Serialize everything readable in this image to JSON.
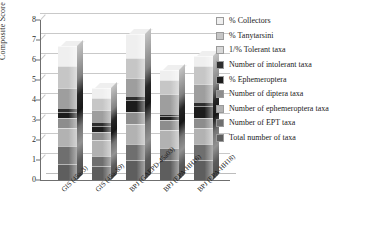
{
  "chart_data": {
    "type": "bar",
    "stacked": true,
    "title": "",
    "xlabel": "",
    "ylabel": "Composite Score",
    "ylim": [
      0,
      8
    ],
    "yticks": [
      0,
      1,
      2,
      3,
      4,
      5,
      6,
      7,
      8
    ],
    "grid": true,
    "legend_position": "right",
    "categories": [
      "GIS (45a-3)",
      "GIS (45a-89)",
      "BPJ (GAEPD-45a03)",
      "BPJ (EPA-HH16)",
      "BPJ (EPA-HH18)"
    ],
    "series": [
      {
        "name": "Total number of taxa",
        "color": "#5e5e5e",
        "values": [
          0.8,
          0.7,
          1.0,
          1.0,
          1.0
        ]
      },
      {
        "name": "Number of EPT taxa",
        "color": "#6f6f6f",
        "values": [
          0.9,
          0.5,
          0.8,
          0.6,
          0.8
        ]
      },
      {
        "name": "Number of ephemeroptera taxa",
        "color": "#b2b2b2",
        "values": [
          0.9,
          0.8,
          1.0,
          0.9,
          0.8
        ]
      },
      {
        "name": "Number of diptera taxa",
        "color": "#8d8d8d",
        "values": [
          0.5,
          0.4,
          0.6,
          0.5,
          0.5
        ]
      },
      {
        "name": "% Ephemeroptera",
        "color": "#1c1c1c",
        "values": [
          0.3,
          0.3,
          0.6,
          0.2,
          0.6
        ]
      },
      {
        "name": "Number of intolerant taxa",
        "color": "#2e2e2e",
        "values": [
          0.2,
          0.2,
          0.2,
          0.1,
          0.2
        ]
      },
      {
        "name": "1/% Tolerant taxa",
        "color": "#9e9e9e",
        "values": [
          1.0,
          0.6,
          0.9,
          1.0,
          0.9
        ]
      },
      {
        "name": "% Tanytarsini",
        "color": "#c6c6c6",
        "values": [
          1.1,
          0.6,
          1.0,
          0.7,
          0.9
        ]
      },
      {
        "name": "% Collectors",
        "color": "#efefef",
        "values": [
          1.0,
          0.5,
          1.2,
          0.5,
          0.5
        ]
      }
    ],
    "totals": [
      6.7,
      4.6,
      7.3,
      5.5,
      6.2
    ]
  },
  "legend": {
    "items": [
      {
        "label": "% Collectors",
        "color": "#efefef"
      },
      {
        "label": "% Tanytarsini",
        "color": "#c6c6c6"
      },
      {
        "label": "1/% Tolerant taxa",
        "color": "#d8d8d8"
      },
      {
        "label": "Number of intolerant taxa",
        "color": "#2e2e2e"
      },
      {
        "label": "% Ephemeroptera",
        "color": "#1c1c1c"
      },
      {
        "label": "Number of diptera taxa",
        "color": "#8d8d8d"
      },
      {
        "label": "Number of ephemeroptera taxa",
        "color": "#b2b2b2"
      },
      {
        "label": "Number of EPT taxa",
        "color": "#6f6f6f"
      },
      {
        "label": "Total number of taxa",
        "color": "#5e5e5e"
      }
    ]
  }
}
